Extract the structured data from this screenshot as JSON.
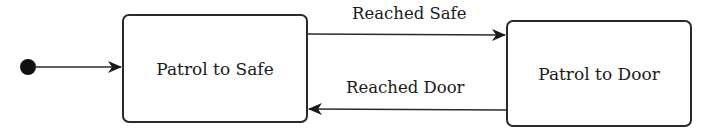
{
  "diagram": {
    "type": "state-machine",
    "initial_state": "Patrol to Safe",
    "states": [
      {
        "id": "s1",
        "label": "Patrol to Safe"
      },
      {
        "id": "s2",
        "label": "Patrol to Door"
      }
    ],
    "transitions": [
      {
        "from": "initial",
        "to": "s1",
        "label": ""
      },
      {
        "from": "s1",
        "to": "s2",
        "label": "Reached Safe"
      },
      {
        "from": "s2",
        "to": "s1",
        "label": "Reached Door"
      }
    ],
    "colors": {
      "stroke": "#2a2a2a",
      "fill": "#ffffff",
      "text": "#1a1a1a"
    }
  }
}
